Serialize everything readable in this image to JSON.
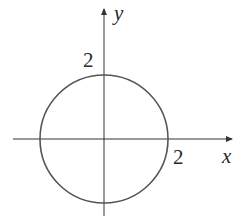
{
  "figure": {
    "type": "circle-on-axes",
    "equation_implied": "x^2 + y^2 = 4",
    "axes": {
      "x_label": "x",
      "y_label": "y"
    },
    "tick_labels": {
      "x_intercept": "2",
      "y_intercept": "2"
    },
    "circle": {
      "center": [
        0,
        0
      ],
      "radius": 2
    },
    "colors": {
      "axis": "#333333",
      "curve": "#555555",
      "text": "#2a2a2a"
    }
  }
}
